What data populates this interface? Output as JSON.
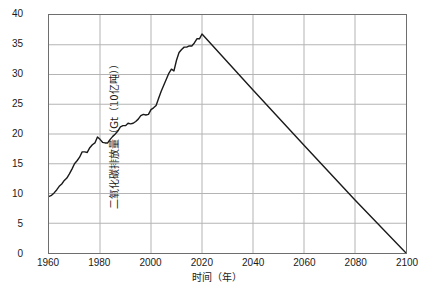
{
  "chart_data": {
    "type": "line",
    "title": "",
    "xlabel": "时间（年）",
    "ylabel": "二氧化碳排放量（Gt（10亿吨））",
    "xlim": [
      1960,
      2100
    ],
    "ylim": [
      0,
      40
    ],
    "grid": true,
    "legend": "none",
    "xticks": [
      "1960",
      "1980",
      "2000",
      "2020",
      "2040",
      "2060",
      "2080",
      "2100"
    ],
    "xtick_values": [
      1960,
      1980,
      2000,
      2020,
      2040,
      2060,
      2080,
      2100
    ],
    "yticks": [
      "0",
      "5",
      "10",
      "15",
      "20",
      "25",
      "30",
      "35",
      "40"
    ],
    "ytick_values": [
      0,
      5,
      10,
      15,
      20,
      25,
      30,
      35,
      40
    ],
    "line_color": "#1a1a1a",
    "grid_color": "#b4b4b4",
    "frame_color": "#6e6e6e",
    "background_color": "#ffffff",
    "series": [
      {
        "name": "二氧化碳排放量",
        "x": [
          1960,
          1961,
          1962,
          1963,
          1964,
          1965,
          1966,
          1967,
          1968,
          1969,
          1970,
          1971,
          1972,
          1973,
          1974,
          1975,
          1976,
          1977,
          1978,
          1979,
          1980,
          1981,
          1982,
          1983,
          1984,
          1985,
          1986,
          1987,
          1988,
          1989,
          1990,
          1991,
          1992,
          1993,
          1994,
          1995,
          1996,
          1997,
          1998,
          1999,
          2000,
          2001,
          2002,
          2003,
          2004,
          2005,
          2006,
          2007,
          2008,
          2009,
          2010,
          2011,
          2012,
          2013,
          2014,
          2015,
          2016,
          2017,
          2018,
          2019,
          2020,
          2040,
          2060,
          2080,
          2100
        ],
        "y": [
          9.5,
          9.7,
          10.1,
          10.6,
          11.2,
          11.6,
          12.2,
          12.6,
          13.3,
          14.1,
          15.0,
          15.5,
          16.1,
          17.0,
          17.0,
          16.9,
          17.7,
          18.2,
          18.5,
          19.5,
          19.1,
          18.6,
          18.5,
          18.5,
          19.1,
          19.6,
          20.0,
          20.5,
          21.2,
          21.4,
          21.4,
          21.8,
          21.7,
          21.8,
          22.1,
          22.5,
          23.1,
          23.3,
          23.2,
          23.3,
          24.1,
          24.4,
          24.8,
          26.0,
          27.2,
          28.2,
          29.2,
          30.2,
          30.9,
          30.6,
          32.4,
          33.7,
          34.2,
          34.6,
          34.6,
          34.8,
          34.8,
          35.3,
          36.0,
          36.0,
          36.8,
          27.4,
          18.1,
          8.9,
          0.0
        ]
      }
    ],
    "annotations": {
      "peak_year": 2020,
      "peak_value": 36.8,
      "start_year": 1960,
      "start_value": 9.5,
      "net_zero_year": 2100,
      "net_zero_value": 0
    }
  }
}
